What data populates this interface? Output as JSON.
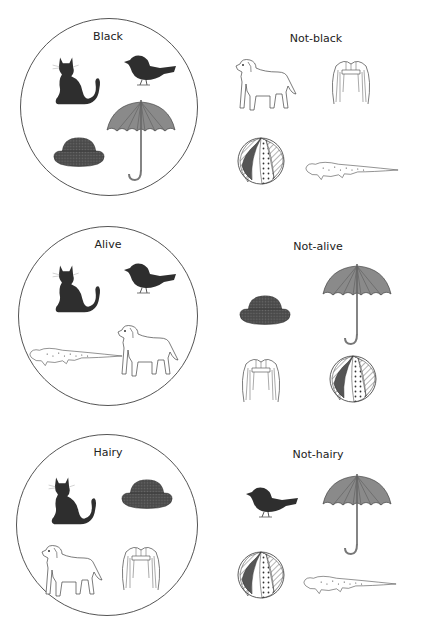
{
  "figure": {
    "rows": [
      {
        "set_label": "Black",
        "complement_label": "Not-black",
        "inside": [
          "cat",
          "bird",
          "hat",
          "umbrella"
        ],
        "outside": [
          "dog",
          "wig",
          "beach-ball",
          "lizard"
        ]
      },
      {
        "set_label": "Alive",
        "complement_label": "Not-alive",
        "inside": [
          "cat",
          "bird",
          "lizard",
          "dog"
        ],
        "outside": [
          "hat",
          "umbrella",
          "wig",
          "beach-ball"
        ]
      },
      {
        "set_label": "Hairy",
        "complement_label": "Not-hairy",
        "inside": [
          "cat",
          "hat",
          "dog",
          "wig"
        ],
        "outside": [
          "bird",
          "umbrella",
          "beach-ball",
          "lizard"
        ]
      }
    ]
  },
  "colors": {
    "dark_fill": "#2e2e2e",
    "umbrella_fill": "#8a8a8a",
    "hat_fill": "#4a4a4a",
    "outline": "#444444",
    "background": "#ffffff"
  }
}
